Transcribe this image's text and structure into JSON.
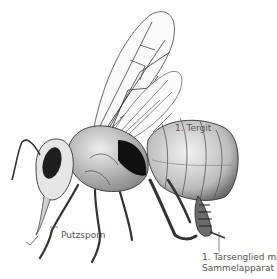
{
  "diagram": {
    "labels": {
      "tergit": "1. Tergit",
      "putzsporn": "Putzsporn",
      "tarsenglied_line1": "1. Tarsenglied mit",
      "tarsenglied_line2": "Sammelapparat"
    },
    "colors": {
      "background": "#ffffff",
      "ink": "#1a1a1a",
      "label_text": "#555555",
      "leader_line": "#555555"
    }
  }
}
